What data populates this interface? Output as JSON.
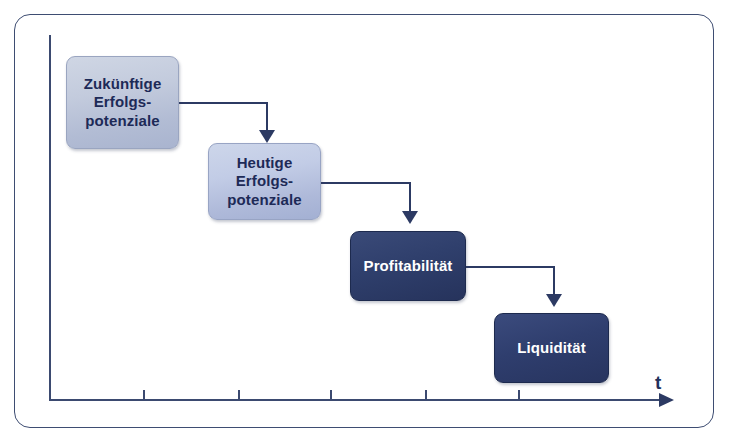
{
  "diagram": {
    "type": "cascading-waterfall-flow",
    "nodes": [
      {
        "id": "zukuenftige",
        "label": "Zukünftige\nErfolgs-\npotenziale",
        "style": "light",
        "x": 66,
        "y": 56,
        "w": 113,
        "h": 93
      },
      {
        "id": "heutige",
        "label": "Heutige\nErfolgs-\npotenziale",
        "style": "light2",
        "x": 208,
        "y": 143,
        "w": 113,
        "h": 77
      },
      {
        "id": "profit",
        "label": "Profitabilität",
        "style": "mid",
        "x": 350,
        "y": 231,
        "w": 116,
        "h": 70
      },
      {
        "id": "liquidity",
        "label": "Liquidität",
        "style": "dark",
        "x": 494,
        "y": 313,
        "w": 115,
        "h": 70
      }
    ],
    "connectors": [
      {
        "from": "zukuenftige",
        "to": "heutige",
        "hx": 179,
        "hy": 102,
        "hw": 88,
        "vx": 266,
        "vy": 102,
        "vh": 30,
        "ax": 259,
        "ay": 130
      },
      {
        "from": "heutige",
        "to": "profit",
        "hx": 321,
        "hy": 182,
        "hw": 90,
        "vx": 409,
        "vy": 182,
        "vh": 31,
        "ax": 402,
        "ay": 211
      },
      {
        "from": "profit",
        "to": "liquidity",
        "hx": 466,
        "hy": 266,
        "hw": 88,
        "vx": 553,
        "vy": 266,
        "vh": 30,
        "ax": 546,
        "ay": 294
      }
    ],
    "axis": {
      "label_t": "t",
      "label_t_x": 655,
      "label_t_y": 372,
      "ticks": [
        143,
        238,
        330,
        425,
        518
      ],
      "arrow_name": "axis-arrow-right"
    },
    "colors": {
      "frame": "#3e4d72",
      "axis": "#3b4a70",
      "connector": "#2c3a63",
      "light_box_fill": "#c3cbdd",
      "light_box_text": "#1d2a57",
      "dark_box_fill": "#2f3e6e",
      "dark_box_text": "#ffffff",
      "background": "#ffffff"
    }
  }
}
